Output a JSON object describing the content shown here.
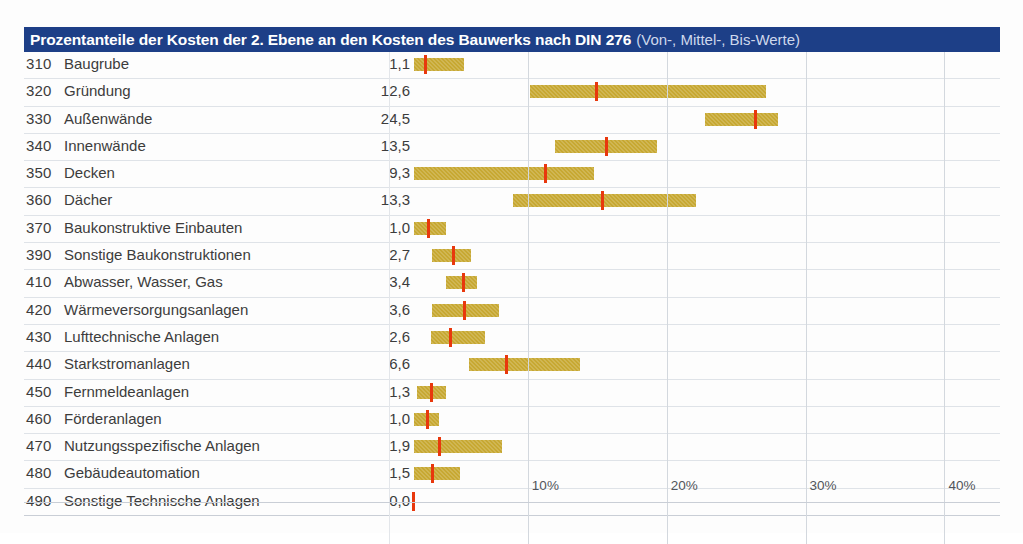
{
  "header": {
    "title_main": "Prozentanteile der Kosten der 2. Ebene an den Kosten des Bauwerks nach DIN 276",
    "title_sub": "(Von-, Mittel-, Bis-Werte)",
    "bar_color": "#1d3f87"
  },
  "colors": {
    "bar": "#c7a832",
    "marker": "#e8380d",
    "gridline": "#d3d8de"
  },
  "chart_data": {
    "type": "bar",
    "title": "Prozentanteile der Kosten der 2. Ebene an den Kosten des Bauwerks nach DIN 276 (Von-, Mittel-, Bis-Werte)",
    "xlabel": "",
    "ylabel": "",
    "xlim": [
      0,
      44
    ],
    "grid": true,
    "legend": "none",
    "tick_labels": [
      "10%",
      "20%",
      "30%",
      "40%"
    ],
    "tick_values": [
      10,
      20,
      30,
      40
    ],
    "columns": [
      "Kostengruppe",
      "Bezeichnung",
      "Mittelwert"
    ],
    "categories": [
      "Baugrube",
      "Gründung",
      "Außenwände",
      "Innenwände",
      "Decken",
      "Dächer",
      "Baukonstruktive Einbauten",
      "Sonstige Baukonstruktionen",
      "Abwasser, Wasser, Gas",
      "Wärmeversorgungsanlagen",
      "Lufttechnische Anlagen",
      "Starkstromanlagen",
      "Fernmeldeanlagen",
      "Förderanlagen",
      "Nutzungsspezifische Anlagen",
      "Gebäudeautomation",
      "Sonstige Technische Anlagen"
    ],
    "values": [
      1.1,
      12.6,
      24.5,
      13.5,
      9.3,
      13.3,
      1.0,
      2.7,
      3.4,
      3.6,
      2.6,
      6.6,
      1.3,
      1.0,
      1.9,
      1.5,
      0.0
    ],
    "rows": [
      {
        "code": "310",
        "label": "Baugrube",
        "value": "1,1",
        "von": 0.1,
        "mittel": 0.9,
        "bis": 3.7
      },
      {
        "code": "320",
        "label": "Gründung",
        "value": "12,6",
        "von": 8.4,
        "mittel": 13.2,
        "bis": 25.4
      },
      {
        "code": "330",
        "label": "Außenwände",
        "value": "24,5",
        "von": 21.0,
        "mittel": 24.6,
        "bis": 26.3
      },
      {
        "code": "340",
        "label": "Innenwände",
        "value": "13,5",
        "von": 10.2,
        "mittel": 13.9,
        "bis": 17.6
      },
      {
        "code": "350",
        "label": "Decken",
        "value": "9,3",
        "von": 0.1,
        "mittel": 9.5,
        "bis": 13.0
      },
      {
        "code": "360",
        "label": "Dächer",
        "von": 7.2,
        "mittel": 13.6,
        "bis": 20.4,
        "value": "13,3"
      },
      {
        "code": "370",
        "label": "Baukonstruktive Einbauten",
        "value": "1,0",
        "von": 0.1,
        "mittel": 1.1,
        "bis": 2.4
      },
      {
        "code": "390",
        "label": "Sonstige Baukonstruktionen",
        "value": "2,7",
        "von": 1.4,
        "mittel": 2.9,
        "bis": 4.2
      },
      {
        "code": "410",
        "label": "Abwasser, Wasser, Gas",
        "value": "3,4",
        "von": 2.4,
        "mittel": 3.6,
        "bis": 4.6
      },
      {
        "code": "420",
        "label": "Wärmeversorgungsanlagen",
        "value": "3,6",
        "von": 1.4,
        "mittel": 3.7,
        "bis": 6.2
      },
      {
        "code": "430",
        "label": "Lufttechnische Anlagen",
        "value": "2,6",
        "von": 1.3,
        "mittel": 2.7,
        "bis": 5.2
      },
      {
        "code": "440",
        "label": "Starkstromanlagen",
        "value": "6,6",
        "von": 4.0,
        "mittel": 6.7,
        "bis": 12.0
      },
      {
        "code": "450",
        "label": "Fernmeldeanlagen",
        "value": "1,3",
        "von": 0.3,
        "mittel": 1.3,
        "bis": 2.4
      },
      {
        "code": "460",
        "label": "Förderanlagen",
        "value": "1,0",
        "von": 0.1,
        "mittel": 1.0,
        "bis": 1.9
      },
      {
        "code": "470",
        "label": "Nutzungsspezifische Anlagen",
        "value": "1,9",
        "von": 0.1,
        "mittel": 1.9,
        "bis": 6.4
      },
      {
        "code": "480",
        "label": "Gebäudeautomation",
        "value": "1,5",
        "von": 0.1,
        "mittel": 1.4,
        "bis": 3.4
      },
      {
        "code": "490",
        "label": "Sonstige Technische Anlagen",
        "value": "0,0",
        "von": 0.0,
        "mittel": 0.0,
        "bis": 0.0
      }
    ]
  }
}
